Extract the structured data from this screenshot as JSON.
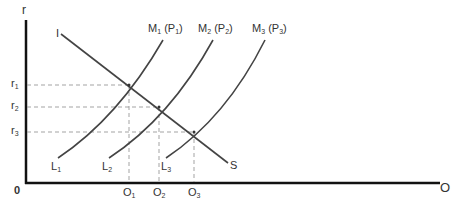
{
  "diagram": {
    "type": "IS-LM style interest-output diagram",
    "axes": {
      "y_label": "r",
      "x_label": "O",
      "origin_label": "0"
    },
    "y_ticks": [
      {
        "base": "r",
        "sub": "1",
        "y": 85
      },
      {
        "base": "r",
        "sub": "2",
        "y": 107
      },
      {
        "base": "r",
        "sub": "3",
        "y": 132
      }
    ],
    "x_ticks": [
      {
        "base": "O",
        "sub": "1",
        "x": 129
      },
      {
        "base": "O",
        "sub": "2",
        "x": 159
      },
      {
        "base": "O",
        "sub": "3",
        "x": 194
      }
    ],
    "is_curve": {
      "start_label": "I",
      "end_label": "S"
    },
    "lm_curves": [
      {
        "top_label": "M",
        "top_sub": "1",
        "param": "P",
        "param_sub": "1",
        "bottom_label": "L",
        "bottom_sub": "1"
      },
      {
        "top_label": "M",
        "top_sub": "2",
        "param": "P",
        "param_sub": "2",
        "bottom_label": "L",
        "bottom_sub": "2"
      },
      {
        "top_label": "M",
        "top_sub": "3",
        "param": "P",
        "param_sub": "3",
        "bottom_label": "L",
        "bottom_sub": "3"
      }
    ],
    "colors": {
      "axis": "#111111",
      "curve": "#444444",
      "guide": "#999999",
      "text": "#333333"
    }
  }
}
